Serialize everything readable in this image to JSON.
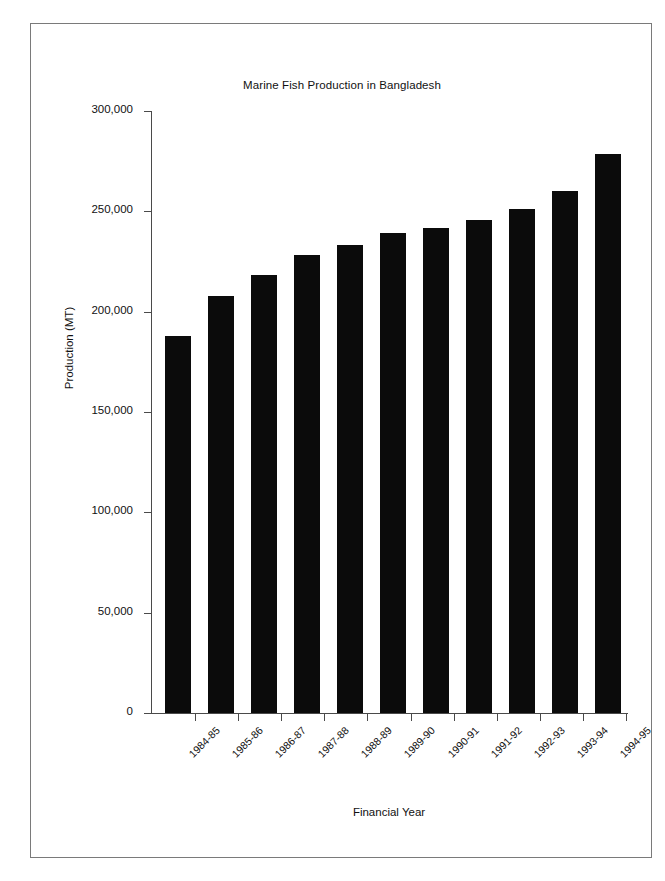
{
  "chart_data": {
    "type": "bar",
    "title": "Marine Fish Production in Bangladesh",
    "xlabel": "Financial Year",
    "ylabel": "Production (MT)",
    "categories": [
      "1984-85",
      "1985-86",
      "1986-87",
      "1987-88",
      "1988-89",
      "1989-90",
      "1990-91",
      "1991-92",
      "1992-93",
      "1993-94",
      "1994-95"
    ],
    "values": [
      188000,
      208000,
      218500,
      228000,
      233000,
      239000,
      241500,
      245500,
      251000,
      260000,
      278500
    ],
    "ylim": [
      0,
      300000
    ],
    "ytick_values": [
      0,
      50000,
      100000,
      150000,
      200000,
      250000,
      300000
    ],
    "ytick_labels": [
      "0",
      "50,000",
      "100,000",
      "150,000",
      "200,000",
      "250,000",
      "300,000"
    ],
    "grid": false,
    "legend": false,
    "bar_color": "#0b0b0b",
    "axis_color": "#4a4a4a",
    "frame_color": "#7a7a7a",
    "xtick_rotation": -45
  }
}
